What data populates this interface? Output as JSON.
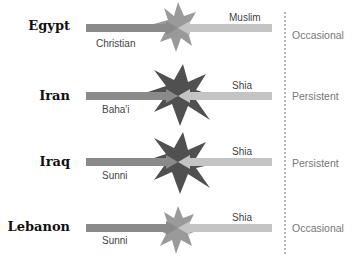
{
  "diagram": {
    "type": "conflict-diagram",
    "rows": [
      {
        "country": "Egypt",
        "left_group": "Christian",
        "right_group": "Muslim",
        "intensity": "Occasional",
        "y": 26
      },
      {
        "country": "Iran",
        "left_group": "Baha'i",
        "right_group": "Shia",
        "intensity": "Persistent",
        "y": 96
      },
      {
        "country": "Iraq",
        "left_group": "Sunni",
        "right_group": "Shia",
        "intensity": "Persistent",
        "y": 162
      },
      {
        "country": "Lebanon",
        "left_group": "Sunni",
        "right_group": "Shia",
        "intensity": "Occasional",
        "y": 228
      }
    ],
    "colors": {
      "left_arrow": "#8a8a8a",
      "right_arrow": "#bdbdbd",
      "star_occasional": "#999999",
      "star_persistent": "#505050",
      "divider": "#888888"
    }
  }
}
